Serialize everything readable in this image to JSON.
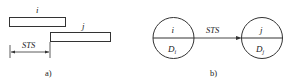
{
  "panel_a": {
    "caption": "a)",
    "task_i_label": "i",
    "task_j_label": "j",
    "lag_label": "STS"
  },
  "panel_b": {
    "caption": "b)",
    "node_i": {
      "top": "i",
      "bottom": "D",
      "bottom_sub": "i"
    },
    "node_j": {
      "top": "j",
      "bottom": "D",
      "bottom_sub": "j"
    },
    "arrow_label": "STS"
  },
  "colors": {
    "stroke": "#333333",
    "text": "#222222",
    "background": "#ffffff"
  }
}
